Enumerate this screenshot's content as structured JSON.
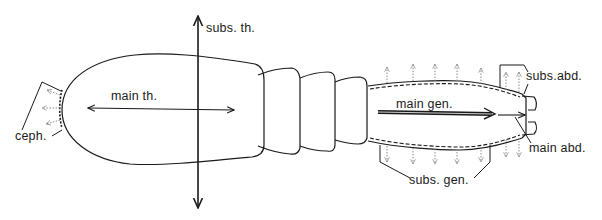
{
  "figure": {
    "type": "anatomical diagram of insect body with axis arrows",
    "labels": {
      "subs_th": "subs. th.",
      "main_th": "main th.",
      "ceph": "ceph.",
      "main_gen": "main gen.",
      "subs_gen": "subs. gen.",
      "subs_abd": "subs.abd.",
      "main_abd": "main abd."
    },
    "colors": {
      "line": "#1a1a1a",
      "dotted_arrow": "#777777",
      "background": "#ffffff"
    }
  }
}
